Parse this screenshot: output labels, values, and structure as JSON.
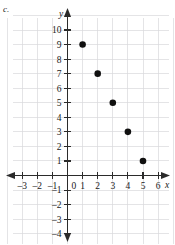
{
  "part_label": "c.",
  "chart_data": {
    "type": "scatter",
    "title": "",
    "subtitle": "",
    "xlabel": "x",
    "ylabel": "y",
    "xlim": [
      -3.6,
      6.6
    ],
    "ylim": [
      -4.6,
      10.6
    ],
    "xticks": [
      -3,
      -2,
      -1,
      1,
      2,
      3,
      4,
      5,
      6
    ],
    "yticks": [
      -4,
      -3,
      -2,
      -1,
      1,
      2,
      3,
      4,
      5,
      6,
      7,
      8,
      9,
      10
    ],
    "xtick_labels": [
      "-3",
      "-2",
      "-1",
      "1",
      "2",
      "3",
      "4",
      "5",
      "6"
    ],
    "ytick_labels": [
      "-4",
      "-3",
      "-2",
      "-1",
      "1",
      "2",
      "3",
      "4",
      "5",
      "6",
      "7",
      "8",
      "9",
      "10"
    ],
    "origin_label": "0",
    "grid": true,
    "grid_color": "#d8d8dc",
    "axis_color": "#2b2b2b",
    "point_color": "#101010",
    "legend": null,
    "x": [
      1,
      2,
      3,
      4,
      5
    ],
    "y": [
      9,
      7,
      5,
      3,
      1
    ],
    "points": [
      {
        "x": 1,
        "y": 9
      },
      {
        "x": 2,
        "y": 7
      },
      {
        "x": 3,
        "y": 5
      },
      {
        "x": 4,
        "y": 3
      },
      {
        "x": 5,
        "y": 1
      }
    ]
  }
}
